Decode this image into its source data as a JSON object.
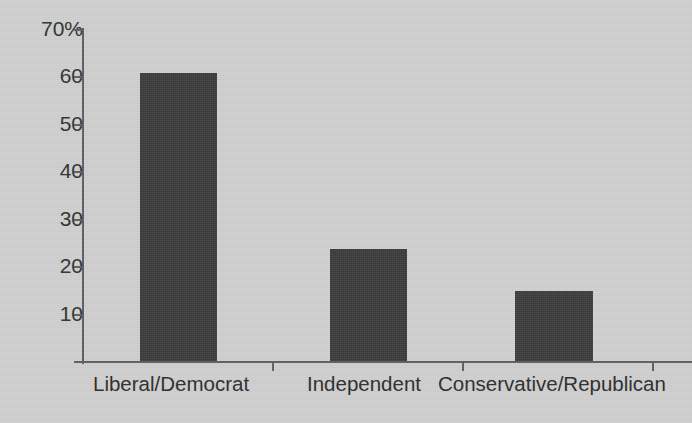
{
  "chart_data": {
    "type": "bar",
    "title": "",
    "subtitle": "",
    "xlabel": "",
    "ylabel": "",
    "categories": [
      "Liberal/Democrat",
      "Independent",
      "Conservative/Republican"
    ],
    "values": [
      61,
      23.7,
      14.8
    ],
    "series": [
      {
        "name": "",
        "values": [
          61,
          23.7,
          14.8
        ]
      }
    ],
    "ylim": [
      0,
      70
    ],
    "ytick_values": [
      70,
      60,
      50,
      40,
      30,
      20,
      10
    ],
    "ytick_labels": [
      "70%",
      "60",
      "50",
      "40",
      "30",
      "20",
      "10"
    ],
    "grid": false,
    "legend": null,
    "legend_position": "none",
    "bar_color": "#3b3c3b",
    "axis_color": "#5d5e5d",
    "background_color": "#cfd0cf",
    "text_color": "#2b2c2b",
    "annotations": []
  }
}
